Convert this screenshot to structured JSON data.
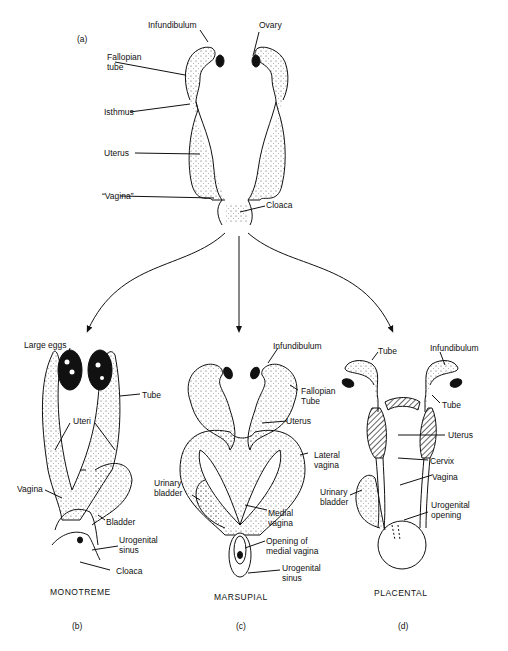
{
  "panel_a": {
    "tag": "(a)",
    "labels": {
      "infundibulum": "Infundibulum",
      "ovary": "Ovary",
      "fallopian_tube": "Fallopian\ntube",
      "isthmus": "Isthmus",
      "uterus": "Uterus",
      "vagina": "“Vagina”",
      "cloaca": "Cloaca"
    }
  },
  "panel_b": {
    "tag": "(b)",
    "caption": "MONOTREME",
    "labels": {
      "large_eggs": "Large eggs",
      "tube": "Tube",
      "uteri": "Uteri",
      "vagina": "Vagina",
      "bladder": "Bladder",
      "urogenital_sinus": "Urogenital\nsinus",
      "cloaca": "Cloaca"
    }
  },
  "panel_c": {
    "tag": "(c)",
    "caption": "MARSUPIAL",
    "labels": {
      "infundibulum": "Infundibulum",
      "fallopian_tube": "Fallopian\nTube",
      "uterus": "Uterus",
      "lateral_vagina": "Lateral\nvagina",
      "urinary_bladder": "Urinary\nbladder",
      "medial_vagina": "Medial\nvagina",
      "opening_medial_vagina": "Opening of\nmedial vagina",
      "urogenital_sinus": "Urogenital\nsinus"
    }
  },
  "panel_d": {
    "tag": "(d)",
    "caption": "PLACENTAL",
    "labels": {
      "tube_left": "Tube",
      "infundibulum": "Infundibulum",
      "tube_right": "Tube",
      "uterus": "Uterus",
      "cervix": "Cervix",
      "vagina": "Vagina",
      "urinary_bladder": "Urinary\nbladder",
      "urogenital_opening": "Urogenital\nopening"
    }
  }
}
